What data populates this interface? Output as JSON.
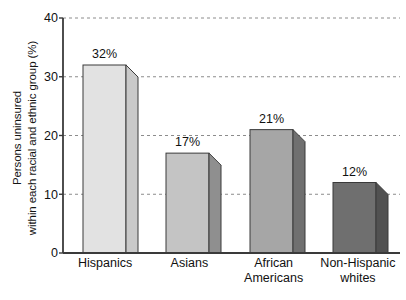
{
  "chart_data": {
    "type": "bar",
    "title": "",
    "subtitle": "",
    "xlabel": "",
    "ylabel": "Persons uninsured within each racial and ethnic group (%)",
    "ylabel_lines": [
      "Persons uninsured",
      "within each racial and ethnic group (%)"
    ],
    "categories": [
      "Hispanics",
      "Asians",
      "African Americans",
      "Non-Hispanic whites"
    ],
    "category_lines": [
      [
        "Hispanics"
      ],
      [
        "Asians"
      ],
      [
        "African",
        "Americans"
      ],
      [
        "Non-Hispanic",
        "whites"
      ]
    ],
    "values": [
      32,
      17,
      21,
      12
    ],
    "data_labels": [
      "32%",
      "17%",
      "21%",
      "12%"
    ],
    "ylim": [
      0,
      40
    ],
    "yticks": [
      0,
      10,
      20,
      30,
      40
    ],
    "ytick_labels": [
      "0",
      "10",
      "20",
      "30",
      "40"
    ],
    "grid": true,
    "grid_style": "dashed-horizontal",
    "legend": "none",
    "style": "3d-bars",
    "bar_colors": [
      "#e2e2e2",
      "#c4c4c4",
      "#a6a6a6",
      "#6f6f6f"
    ],
    "bar_side_colors": [
      "#c9c9c9",
      "#8f8f8f",
      "#707070",
      "#515151"
    ],
    "axis_color": "#3a3a3a",
    "grid_color": "#8c8c8c"
  }
}
